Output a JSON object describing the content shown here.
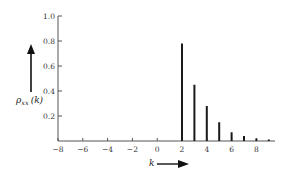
{
  "chart_data": {
    "type": "bar",
    "subtype": "stem",
    "title": "",
    "xlabel": "k",
    "ylabel": "ρ_xx (k)",
    "ylabel_main": "ρ",
    "ylabel_sub": "xx",
    "ylabel_arg": "(k)",
    "xlim": [
      -8,
      9.5
    ],
    "ylim": [
      0,
      1.0
    ],
    "x_ticks": [
      -8,
      -6,
      -4,
      -2,
      0,
      2,
      4,
      6,
      8
    ],
    "x_tick_labels": [
      "−8",
      "−6",
      "−4",
      "−2",
      "0",
      "2",
      "4",
      "6",
      "8"
    ],
    "y_ticks": [
      0.2,
      0.4,
      0.6,
      0.8,
      1.0
    ],
    "y_tick_labels": [
      "0.2",
      "0.4",
      "0.6",
      "0.8",
      "1.0"
    ],
    "grid": false,
    "legend": null,
    "x": [
      2,
      3,
      4,
      5,
      6,
      7,
      8,
      9
    ],
    "values": [
      0.78,
      0.45,
      0.28,
      0.15,
      0.07,
      0.04,
      0.02,
      0.01
    ],
    "annotations": [
      "arrow pointing up next to y label",
      "arrow pointing right next to x label"
    ]
  },
  "colors": {
    "axis": "#555555",
    "bars": "#1a1a1a",
    "text": "#333333"
  }
}
